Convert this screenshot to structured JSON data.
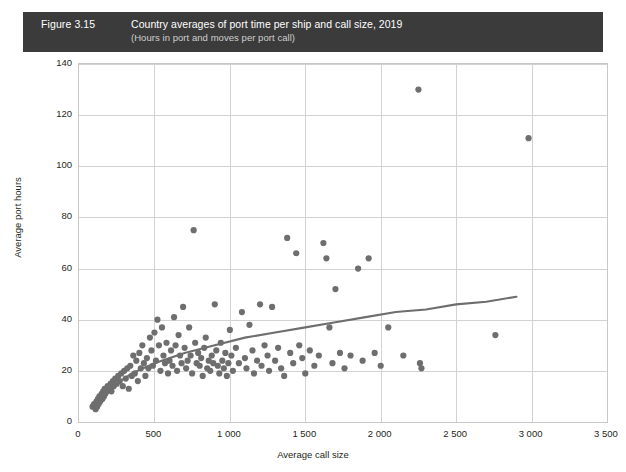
{
  "banner": {
    "figure_number": "Figure 3.15",
    "title": "Country averages of port time per ship and call size, 2019",
    "subtitle": "(Hours in port and moves per port call)",
    "background_color": "#3b3b3b",
    "title_color": "#ffffff",
    "subtitle_color": "#cfcfcf"
  },
  "chart_data": {
    "type": "scatter",
    "title": "Country averages of port time per ship and call size, 2019",
    "subtitle": "(Hours in port and moves per port call)",
    "xlabel": "Average call size",
    "ylabel": "Average port hours",
    "xlim": [
      0,
      3500
    ],
    "ylim": [
      0,
      140
    ],
    "xticks": [
      0,
      500,
      1000,
      1500,
      2000,
      2500,
      3000,
      3500
    ],
    "xtick_labels": [
      "0",
      "500",
      "1 000",
      "1 500",
      "2 000",
      "2 500",
      "3 000",
      "3 500"
    ],
    "yticks": [
      0,
      20,
      40,
      60,
      80,
      100,
      120,
      140
    ],
    "ytick_labels": [
      "0",
      "20",
      "40",
      "60",
      "80",
      "100",
      "120",
      "140"
    ],
    "grid": true,
    "legend": "none",
    "marker_color": "#6e6e6e",
    "marker_size": 5,
    "trend_color": "#6e6e6e",
    "points": [
      [
        90,
        6
      ],
      [
        100,
        7
      ],
      [
        110,
        5
      ],
      [
        115,
        8
      ],
      [
        120,
        6
      ],
      [
        125,
        9
      ],
      [
        130,
        7
      ],
      [
        135,
        10
      ],
      [
        140,
        8
      ],
      [
        150,
        11
      ],
      [
        155,
        9
      ],
      [
        160,
        12
      ],
      [
        165,
        10
      ],
      [
        170,
        13
      ],
      [
        175,
        11
      ],
      [
        185,
        12
      ],
      [
        190,
        14
      ],
      [
        200,
        13
      ],
      [
        210,
        15
      ],
      [
        215,
        12
      ],
      [
        225,
        16
      ],
      [
        230,
        14
      ],
      [
        240,
        17
      ],
      [
        250,
        15
      ],
      [
        260,
        18
      ],
      [
        270,
        16
      ],
      [
        280,
        19
      ],
      [
        290,
        14
      ],
      [
        300,
        20
      ],
      [
        310,
        17
      ],
      [
        320,
        21
      ],
      [
        330,
        13
      ],
      [
        340,
        22
      ],
      [
        350,
        18
      ],
      [
        360,
        26
      ],
      [
        370,
        19
      ],
      [
        380,
        24
      ],
      [
        390,
        16
      ],
      [
        400,
        27
      ],
      [
        410,
        21
      ],
      [
        420,
        30
      ],
      [
        430,
        23
      ],
      [
        440,
        18
      ],
      [
        450,
        25
      ],
      [
        460,
        21
      ],
      [
        470,
        33
      ],
      [
        480,
        28
      ],
      [
        490,
        22
      ],
      [
        500,
        35
      ],
      [
        510,
        24
      ],
      [
        520,
        40
      ],
      [
        530,
        30
      ],
      [
        540,
        20
      ],
      [
        550,
        37
      ],
      [
        560,
        26
      ],
      [
        570,
        23
      ],
      [
        580,
        31
      ],
      [
        590,
        19
      ],
      [
        600,
        24
      ],
      [
        610,
        28
      ],
      [
        620,
        22
      ],
      [
        630,
        41
      ],
      [
        640,
        30
      ],
      [
        650,
        20
      ],
      [
        660,
        34
      ],
      [
        670,
        26
      ],
      [
        680,
        23
      ],
      [
        690,
        45
      ],
      [
        700,
        29
      ],
      [
        710,
        21
      ],
      [
        720,
        24
      ],
      [
        730,
        37
      ],
      [
        740,
        26
      ],
      [
        750,
        19
      ],
      [
        760,
        75
      ],
      [
        770,
        31
      ],
      [
        780,
        23
      ],
      [
        790,
        27
      ],
      [
        800,
        22
      ],
      [
        810,
        25
      ],
      [
        820,
        18
      ],
      [
        830,
        29
      ],
      [
        840,
        33
      ],
      [
        850,
        21
      ],
      [
        860,
        24
      ],
      [
        870,
        20
      ],
      [
        880,
        26
      ],
      [
        890,
        23
      ],
      [
        900,
        46
      ],
      [
        910,
        28
      ],
      [
        920,
        22
      ],
      [
        930,
        19
      ],
      [
        940,
        31
      ],
      [
        950,
        24
      ],
      [
        960,
        21
      ],
      [
        970,
        27
      ],
      [
        980,
        18
      ],
      [
        990,
        23
      ],
      [
        1000,
        36
      ],
      [
        1010,
        26
      ],
      [
        1020,
        20
      ],
      [
        1040,
        29
      ],
      [
        1060,
        23
      ],
      [
        1080,
        43
      ],
      [
        1100,
        25
      ],
      [
        1110,
        21
      ],
      [
        1130,
        38
      ],
      [
        1150,
        28
      ],
      [
        1160,
        19
      ],
      [
        1180,
        24
      ],
      [
        1200,
        46
      ],
      [
        1210,
        22
      ],
      [
        1230,
        30
      ],
      [
        1250,
        26
      ],
      [
        1260,
        20
      ],
      [
        1280,
        45
      ],
      [
        1300,
        24
      ],
      [
        1320,
        29
      ],
      [
        1340,
        21
      ],
      [
        1360,
        18
      ],
      [
        1380,
        72
      ],
      [
        1400,
        27
      ],
      [
        1420,
        23
      ],
      [
        1440,
        66
      ],
      [
        1460,
        30
      ],
      [
        1480,
        25
      ],
      [
        1500,
        19
      ],
      [
        1530,
        28
      ],
      [
        1560,
        22
      ],
      [
        1590,
        26
      ],
      [
        1620,
        70
      ],
      [
        1640,
        64
      ],
      [
        1660,
        37
      ],
      [
        1680,
        23
      ],
      [
        1700,
        52
      ],
      [
        1730,
        27
      ],
      [
        1760,
        21
      ],
      [
        1800,
        26
      ],
      [
        1850,
        60
      ],
      [
        1880,
        24
      ],
      [
        1920,
        64
      ],
      [
        1960,
        27
      ],
      [
        2000,
        22
      ],
      [
        2050,
        37
      ],
      [
        2150,
        26
      ],
      [
        2250,
        130
      ],
      [
        2260,
        23
      ],
      [
        2270,
        21
      ],
      [
        2760,
        34
      ],
      [
        2980,
        111
      ]
    ],
    "trend_line": {
      "description": "Logarithmic fit through scatter",
      "points": [
        [
          90,
          6
        ],
        [
          200,
          13
        ],
        [
          350,
          19
        ],
        [
          500,
          23
        ],
        [
          700,
          27
        ],
        [
          900,
          30
        ],
        [
          1100,
          33
        ],
        [
          1300,
          35
        ],
        [
          1500,
          37
        ],
        [
          1700,
          39
        ],
        [
          1900,
          41
        ],
        [
          2100,
          43
        ],
        [
          2300,
          44
        ],
        [
          2500,
          46
        ],
        [
          2700,
          47
        ],
        [
          2900,
          49
        ]
      ]
    }
  },
  "axes": {
    "x_label": "Average call size",
    "y_label": "Average port hours"
  }
}
